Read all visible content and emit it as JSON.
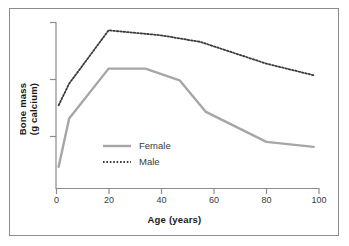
{
  "chart_data": {
    "type": "line",
    "title": "",
    "subtitle": "",
    "xlabel": "Age (years)",
    "ylabel": "Bone mass\n(g calcium)",
    "ylabel_line1": "Bone mass",
    "ylabel_line2": "(g calcium)",
    "xlim": [
      0,
      100
    ],
    "ylim": [
      0,
      100
    ],
    "xticks": [
      0,
      20,
      40,
      60,
      80,
      100
    ],
    "xtick_labels": [
      "0",
      "20",
      "40",
      "60",
      "80",
      "100"
    ],
    "yticks": [
      22,
      56,
      90
    ],
    "ytick_labels": [
      "",
      "",
      ""
    ],
    "grid": false,
    "legend_position": "inside-lower-left",
    "series": [
      {
        "name": "Female",
        "label": "Female",
        "color": "#a6a6a6",
        "style": "solid",
        "width": 2.4,
        "x": [
          1,
          5,
          20,
          34,
          47,
          57,
          80,
          98
        ],
        "y": [
          13,
          42,
          72,
          72,
          65,
          46,
          28,
          25
        ]
      },
      {
        "name": "Male",
        "label": "Male",
        "color": "#3a3a3a",
        "style": "dotted",
        "width": 1.8,
        "x": [
          1,
          5,
          20,
          40,
          55,
          80,
          98
        ],
        "y": [
          50,
          63,
          95,
          92,
          88,
          75,
          68
        ]
      }
    ],
    "annotations": []
  },
  "legend": {
    "items": [
      {
        "label": "Female",
        "swatch": "solid-line-swatch"
      },
      {
        "label": "Male",
        "swatch": "dotted-line-swatch"
      }
    ]
  },
  "colors": {
    "frame": "#8c8c8c",
    "axis": "#8c8c8c",
    "female_line": "#a6a6a6",
    "male_line": "#3a3a3a",
    "text": "#1a1a1a",
    "background": "#ffffff"
  }
}
